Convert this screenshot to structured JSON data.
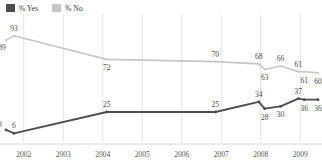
{
  "legend": {
    "items": [
      {
        "label": "% Yes",
        "color": "#4d4d4d",
        "icon": "square-swatch-icon"
      },
      {
        "label": "% No",
        "color": "#c6c6c6",
        "icon": "square-swatch-icon"
      }
    ]
  },
  "axis": {
    "x_ticks": [
      "2002",
      "2003",
      "2004",
      "2005",
      "2006",
      "2007",
      "2008",
      "2009"
    ]
  },
  "chart_data": {
    "type": "line",
    "title": "",
    "subtitle": "",
    "xlabel": "",
    "ylabel": "",
    "xlim": [
      2002,
      2010
    ],
    "ylim": [
      0,
      100
    ],
    "grid": "vertical",
    "legend_position": "top-left",
    "x_tick_labels": [
      "2002",
      "2003",
      "2004",
      "2005",
      "2006",
      "2007",
      "2008",
      "2009"
    ],
    "series": [
      {
        "name": "% No",
        "color": "#c6c6c6",
        "points": [
          {
            "x": 2002.05,
            "value": 89,
            "label": "89",
            "label_pos": "below-left"
          },
          {
            "x": 2002.25,
            "value": 93,
            "label": "93",
            "label_pos": "above"
          },
          {
            "x": 2004.6,
            "value": 72,
            "label": "72",
            "label_pos": "below"
          },
          {
            "x": 2007.35,
            "value": 70,
            "label": "70",
            "label_pos": "above"
          },
          {
            "x": 2008.45,
            "value": 68,
            "label": "68",
            "label_pos": "above"
          },
          {
            "x": 2008.6,
            "value": 63,
            "label": "63",
            "label_pos": "below"
          },
          {
            "x": 2009.0,
            "value": 66,
            "label": "66",
            "label_pos": "above"
          },
          {
            "x": 2009.45,
            "value": 61,
            "label": "61",
            "label_pos": "above"
          },
          {
            "x": 2009.6,
            "value": 61,
            "label": "61",
            "label_pos": "below"
          },
          {
            "x": 2009.95,
            "value": 60,
            "label": "60",
            "label_pos": "below"
          }
        ]
      },
      {
        "name": "% Yes",
        "color": "#4d4d4d",
        "points": [
          {
            "x": 2002.05,
            "value": 9,
            "label": "9",
            "label_pos": "above-left"
          },
          {
            "x": 2002.25,
            "value": 6,
            "label": "6",
            "label_pos": "above"
          },
          {
            "x": 2004.6,
            "value": 25,
            "label": "25",
            "label_pos": "above"
          },
          {
            "x": 2007.35,
            "value": 25,
            "label": "25",
            "label_pos": "above"
          },
          {
            "x": 2008.45,
            "value": 34,
            "label": "34",
            "label_pos": "above"
          },
          {
            "x": 2008.6,
            "value": 28,
            "label": "28",
            "label_pos": "below"
          },
          {
            "x": 2009.0,
            "value": 30,
            "label": "30",
            "label_pos": "below"
          },
          {
            "x": 2009.45,
            "value": 37,
            "label": "37",
            "label_pos": "above"
          },
          {
            "x": 2009.6,
            "value": 36,
            "label": "36",
            "label_pos": "below"
          },
          {
            "x": 2009.95,
            "value": 36,
            "label": "36",
            "label_pos": "below"
          }
        ]
      }
    ]
  }
}
